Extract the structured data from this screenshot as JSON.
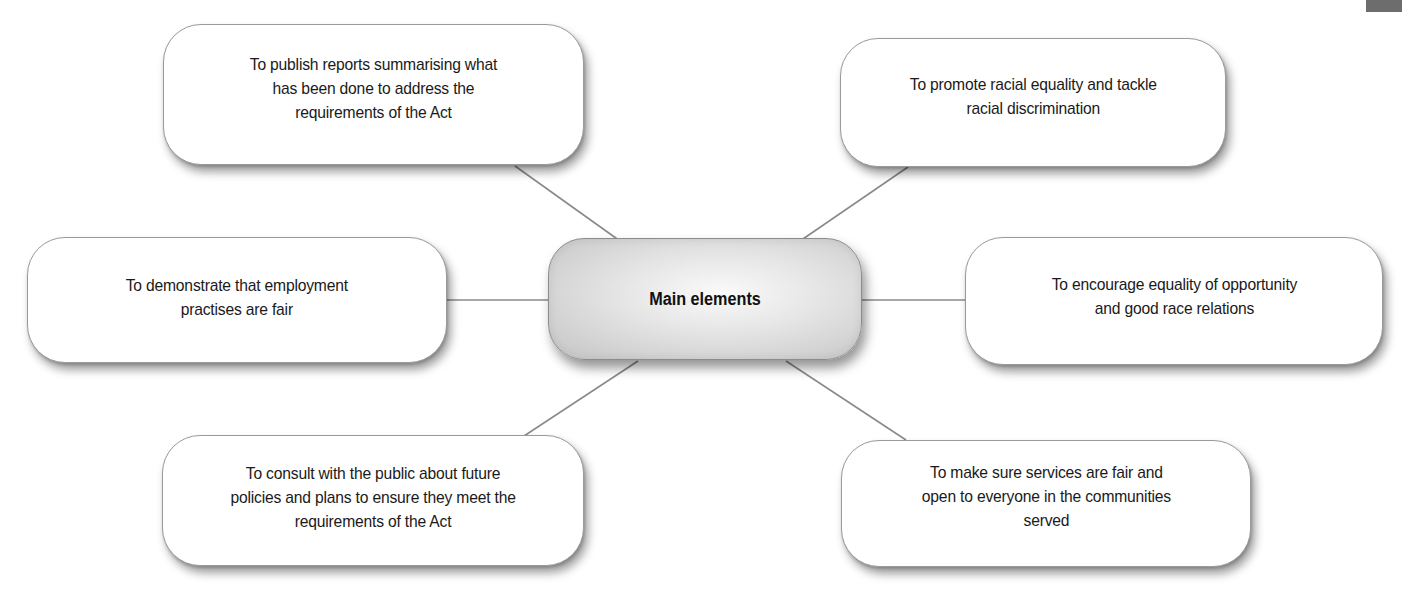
{
  "diagram": {
    "type": "mind-map",
    "center": {
      "label": "Main elements"
    },
    "branches": [
      {
        "id": "top-left",
        "label": "To publish reports summarising what\nhas been done to address the\nrequirements of the Act"
      },
      {
        "id": "top-right",
        "label": "To promote racial equality and tackle\nracial discrimination"
      },
      {
        "id": "left",
        "label": "To demonstrate that employment\npractises are fair"
      },
      {
        "id": "right",
        "label": "To encourage equality of opportunity\nand good race relations"
      },
      {
        "id": "bottom-left",
        "label": "To consult with the public about future\npolicies and plans to ensure they meet the\nrequirements of the Act"
      },
      {
        "id": "bottom-right",
        "label": "To make sure services are fair and\nopen to everyone in the communities\nserved"
      }
    ],
    "colors": {
      "connector": "#8a8a8a",
      "node_border": "#9a9a9a",
      "node_fill": "#ffffff",
      "center_fill": "#dcdcdc",
      "text": "#1a1a1a",
      "corner_bar": "#6d6d6d"
    }
  }
}
